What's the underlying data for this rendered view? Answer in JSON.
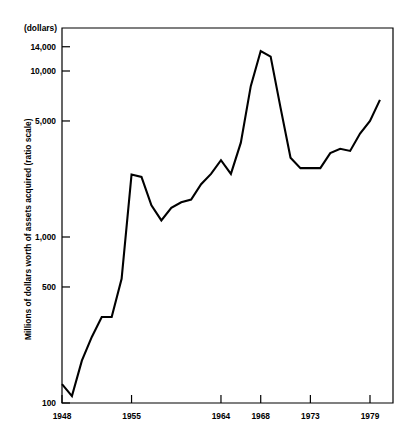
{
  "chart_data": {
    "type": "line",
    "title": "",
    "subtitle": "",
    "unit_note": "(dollars)",
    "xlabel": "",
    "ylabel": "Millions of dollars worth of assets acquired (ratio scale)",
    "yscale": "log",
    "ylim": [
      100,
      18000
    ],
    "xlim": [
      1948,
      1980.9
    ],
    "grid": false,
    "legend": null,
    "ytick_labels": [
      "14,000",
      "10,000",
      "5,000",
      "1,000",
      "500",
      "100"
    ],
    "ytick_values": [
      14000,
      10000,
      5000,
      1000,
      500,
      100
    ],
    "xtick_labels": [
      "1948",
      "1955",
      "1964",
      "1968",
      "1973",
      "1979"
    ],
    "xtick_values": [
      1948,
      1955,
      1964,
      1968,
      1973,
      1979
    ],
    "series": [
      {
        "name": "Value of assets acquired",
        "x": [
          1948,
          1949,
          1950,
          1951,
          1952,
          1953,
          1954,
          1955,
          1956,
          1957,
          1958,
          1959,
          1960,
          1961,
          1962,
          1963,
          1964,
          1965,
          1966,
          1967,
          1968,
          1969,
          1970,
          1971,
          1972,
          1973,
          1974,
          1975,
          1976,
          1977,
          1978,
          1979,
          1980
        ],
        "values": [
          130,
          110,
          180,
          250,
          330,
          330,
          560,
          2380,
          2300,
          1550,
          1260,
          1500,
          1620,
          1680,
          2080,
          2400,
          2900,
          2400,
          3700,
          8100,
          13200,
          12200,
          6000,
          3000,
          2600,
          2600,
          2600,
          3200,
          3400,
          3300,
          4200,
          5000,
          6700
        ],
        "color": "#000000"
      }
    ]
  },
  "axis": {
    "unit_note": "(dollars)",
    "y_title": "Millions of dollars worth of assets acquired (ratio scale)"
  }
}
